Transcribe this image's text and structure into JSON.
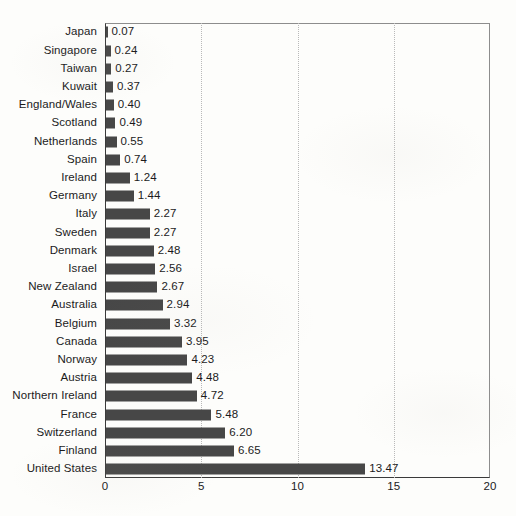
{
  "chart_data": {
    "type": "bar",
    "orientation": "horizontal",
    "title": "",
    "subtitle": "",
    "xlabel": "",
    "ylabel": "",
    "xlim": [
      0,
      20
    ],
    "ylim": null,
    "xticks": [
      "0",
      "5",
      "10",
      "15",
      "20"
    ],
    "xtick_values": [
      0,
      5,
      10,
      15,
      20
    ],
    "gridlines": {
      "vertical": [
        5,
        10,
        15
      ],
      "style": "dotted",
      "horizontal": []
    },
    "legend": null,
    "bar_color": "#474747",
    "frame_color": "#3a3a3a",
    "grid_color": "#b9b9b9",
    "value_label_format": "2-decimal",
    "categories": [
      "Japan",
      "Singapore",
      "Taiwan",
      "Kuwait",
      "England/Wales",
      "Scotland",
      "Netherlands",
      "Spain",
      "Ireland",
      "Germany",
      "Italy",
      "Sweden",
      "Denmark",
      "Israel",
      "New Zealand",
      "Australia",
      "Belgium",
      "Canada",
      "Norway",
      "Austria",
      "Northern Ireland",
      "France",
      "Switzerland",
      "Finland",
      "United States"
    ],
    "values": [
      0.07,
      0.24,
      0.27,
      0.37,
      0.4,
      0.49,
      0.55,
      0.74,
      1.24,
      1.44,
      2.27,
      2.27,
      2.48,
      2.56,
      2.67,
      2.94,
      3.32,
      3.95,
      4.23,
      4.48,
      4.72,
      5.48,
      6.2,
      6.65,
      13.47
    ],
    "value_labels": [
      "0.07",
      "0.24",
      "0.27",
      "0.37",
      "0.40",
      "0.49",
      "0.55",
      "0.74",
      "1.24",
      "1.44",
      "2.27",
      "2.27",
      "2.48",
      "2.56",
      "2.67",
      "2.94",
      "3.32",
      "3.95",
      "4.23",
      "4.48",
      "4.72",
      "5.48",
      "6.20",
      "6.65",
      "13.47"
    ]
  }
}
